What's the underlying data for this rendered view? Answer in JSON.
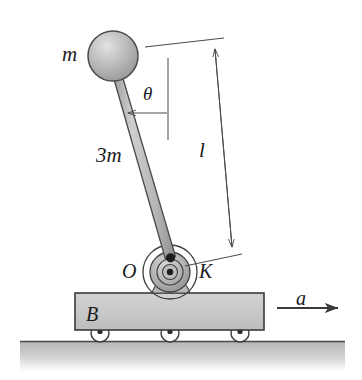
{
  "figure": {
    "background_color": "#ffffff",
    "labels": {
      "ball_mass": "m",
      "rod_mass": "3m",
      "angle": "θ",
      "length": "l",
      "pivot_point": "O",
      "hub_point": "K",
      "cart_body": "B",
      "acceleration": "a"
    },
    "colors": {
      "ink": "#1a1a1a",
      "line": "#3a3a3a",
      "cart_fill": "#c9c9c9",
      "cart_edge": "#3a3a3a",
      "rod_fill": "#b7b7b7",
      "rod_edge": "#4a4a4a",
      "ball_fill": "#b0b0b0",
      "ball_highlight": "#dcdcdc",
      "ball_edge": "#4a4a4a",
      "ground_fill": "#bfbfbf",
      "hub_fill": "#b5b5b5",
      "wheel_fill": "#ffffff",
      "dimension_line": "#555555"
    },
    "geometry": {
      "ball_center": [
        113,
        56
      ],
      "ball_radius": 25,
      "pivot_center": [
        170,
        272
      ],
      "rod_top": [
        118,
        78
      ],
      "rod_half_width": 5,
      "cart_rect": [
        75,
        293,
        189,
        37
      ],
      "wheel_centers": [
        [
          100,
          333
        ],
        [
          170,
          333
        ],
        [
          240,
          333
        ]
      ],
      "wheel_radius": 9,
      "ground_y": 341,
      "ground_x_range": [
        20,
        345
      ],
      "angle_degrees": 15,
      "dimension_arrow_top": [
        218,
        40
      ],
      "dimension_arrow_bottom": [
        233,
        250
      ],
      "accel_arrow": [
        277,
        308,
        340,
        308
      ]
    },
    "parts": [
      {
        "name": "ball",
        "label": "m",
        "description": "shaded sphere at rod top"
      },
      {
        "name": "rod",
        "label": "3m",
        "description": "slender uniform rod"
      },
      {
        "name": "pivot-hub",
        "label": "K",
        "description": "concentric bearing hub"
      },
      {
        "name": "pivot-origin",
        "label": "O",
        "description": "pivot point on cart"
      },
      {
        "name": "cart",
        "label": "B",
        "description": "wheeled block"
      },
      {
        "name": "ground",
        "label": "",
        "description": "hatched ground surface"
      },
      {
        "name": "accel-arrow",
        "label": "a",
        "description": "cart acceleration to the right"
      },
      {
        "name": "length-dimension",
        "label": "l",
        "description": "rod length dimension line"
      },
      {
        "name": "angle-dimension",
        "label": "θ",
        "description": "tilt angle from vertical"
      }
    ]
  }
}
